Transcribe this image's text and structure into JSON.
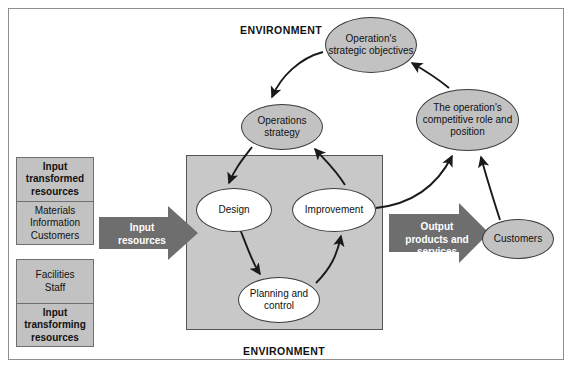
{
  "figure": {
    "environment_top_label": "ENVIRONMENT",
    "environment_bottom_label": "ENVIRONMENT"
  },
  "colors": {
    "process_box_fill": "#c8c8c8",
    "resource_box_fill": "#c2c2c2",
    "strategy_ellipse_fill": "#c2c2c2",
    "activity_ellipse_fill": "#ffffff",
    "block_arrow_fill": "#6e6e6e",
    "frame_border": "#8e8e8e",
    "line_color": "#1a1a1a"
  },
  "input_resources": {
    "transformed": {
      "heading": "Input transformed resources",
      "items": "Materials Information Customers",
      "items_lines": [
        "Materials",
        "Information",
        "Customers"
      ]
    },
    "transforming": {
      "items": "Facilities Staff",
      "items_lines": [
        "Facilities",
        "Staff"
      ],
      "heading": "Input transforming resources"
    }
  },
  "arrows": {
    "input": {
      "label": "Input resources",
      "lines": [
        "Input",
        "resources"
      ]
    },
    "output": {
      "label": "Output products and services",
      "lines": [
        "Output",
        "products and",
        "services"
      ]
    }
  },
  "nodes": {
    "design": "Design",
    "improvement": "Improvement",
    "planning_and_control": "Planning and control",
    "operations_strategy": "Operations strategy",
    "strategic_objectives": "Operation's strategic objectives",
    "competitive_role": "The operation's competitive role and position",
    "customers": "Customers"
  },
  "connections": [
    {
      "from": "strategic_objectives",
      "to": "operations_strategy"
    },
    {
      "from": "operations_strategy",
      "to": "design"
    },
    {
      "from": "design",
      "to": "planning_and_control"
    },
    {
      "from": "planning_and_control",
      "to": "improvement"
    },
    {
      "from": "improvement",
      "to": "operations_strategy"
    },
    {
      "from": "improvement",
      "to": "competitive_role"
    },
    {
      "from": "customers",
      "to": "competitive_role"
    },
    {
      "from": "competitive_role",
      "to": "strategic_objectives"
    }
  ]
}
